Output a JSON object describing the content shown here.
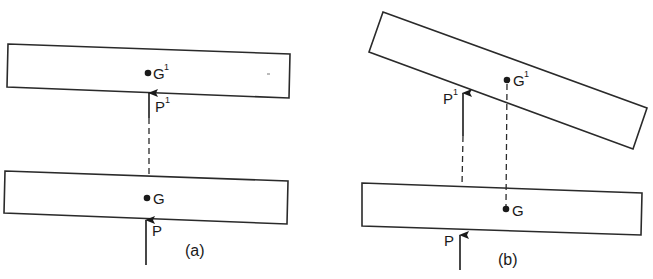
{
  "figure": {
    "panel_a": {
      "caption": "(a)",
      "labels": {
        "g_prime": "G",
        "g_prime_sup": "1",
        "p_prime": "P",
        "p_prime_sup": "1",
        "g": "G",
        "p": "P"
      }
    },
    "panel_b": {
      "caption": "(b)",
      "labels": {
        "g_prime": "G",
        "g_prime_sup": "1",
        "p_prime": "P",
        "p_prime_sup": "1",
        "g": "G",
        "p": "P"
      }
    },
    "colors": {
      "stroke": "#2a2a2a",
      "background": "#ffffff"
    }
  }
}
